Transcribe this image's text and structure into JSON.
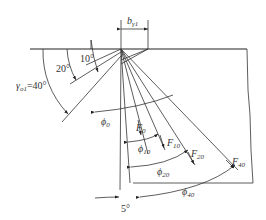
{
  "diagram": {
    "type": "cutting-tool rake angle / chip flow diagram",
    "dimension_label": {
      "main": "b",
      "sub": "γ1"
    },
    "rake_angles": [
      {
        "label": "10°"
      },
      {
        "label": "20°"
      },
      {
        "label": "γ",
        "sub": "o1",
        "value": "=40°"
      }
    ],
    "shear_angles": [
      {
        "main": "ϕ",
        "sub": "0"
      },
      {
        "main": "ϕ",
        "sub": "10"
      },
      {
        "main": "ϕ",
        "sub": "20"
      },
      {
        "main": "ϕ",
        "sub": "40"
      }
    ],
    "forces": [
      {
        "main": "F",
        "sub": "0"
      },
      {
        "main": "F",
        "sub": "10"
      },
      {
        "main": "F",
        "sub": "20"
      },
      {
        "main": "F",
        "sub": "40"
      }
    ],
    "bottom_angle": "5°"
  }
}
